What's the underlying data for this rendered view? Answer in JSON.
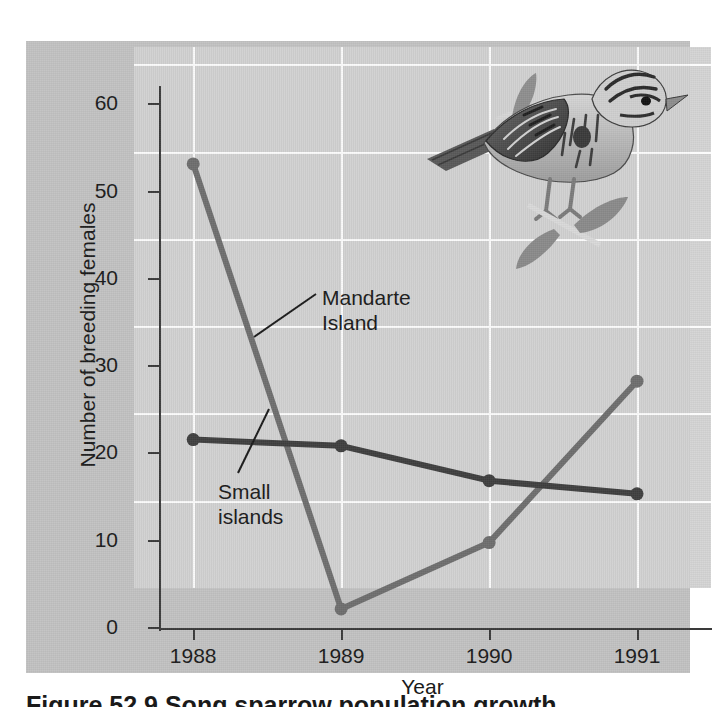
{
  "figure": {
    "y_axis_title": "Number of breeding females",
    "x_axis_title": "Year",
    "caption_partial": "Figure 52.9  Song sparrow population growth",
    "bird_icon_name": "song-sparrow-illustration",
    "colors": {
      "panel_background": "#c2c2c2",
      "plot_background": "#d4d4d4",
      "gridline": "#fbfbfb",
      "axis": "#3a3a3a",
      "series_mandarte": "#6e6e6e",
      "series_small_islands": "#3f3f3f",
      "text": "#1a1a1a"
    }
  },
  "annotations": {
    "mandarte": "Mandarte\nIsland",
    "small_islands": "Small\nislands"
  },
  "chart_data": {
    "type": "line",
    "title": "",
    "xlabel": "Year",
    "ylabel": "Number of breeding females",
    "categories": [
      "1988",
      "1989",
      "1990",
      "1991"
    ],
    "x": [
      1988,
      1989,
      1990,
      1991
    ],
    "xlim": [
      1987.6,
      1991.5
    ],
    "ylim": [
      0,
      62
    ],
    "yticks": [
      0,
      10,
      20,
      30,
      40,
      50,
      60
    ],
    "ytick_labels": [
      "0",
      "10",
      "20",
      "30",
      "40",
      "50",
      "60"
    ],
    "xtick_labels": [
      "1988",
      "1989",
      "1990",
      "1991"
    ],
    "grid": true,
    "legend": "inline-annotations",
    "series": [
      {
        "name": "Mandarte Island",
        "color": "#6e6e6e",
        "values": [
          53.3,
          2.3,
          9.9,
          28.4
        ],
        "marker": "circle"
      },
      {
        "name": "Small islands",
        "color": "#3f3f3f",
        "values": [
          21.7,
          21.0,
          17.0,
          15.5
        ],
        "marker": "circle"
      }
    ]
  }
}
